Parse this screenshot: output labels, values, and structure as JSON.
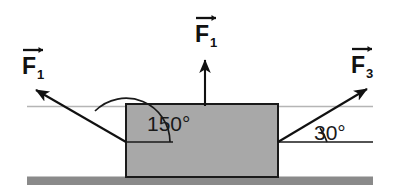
{
  "figure": {
    "type": "free-body-force-diagram",
    "background_color": "#ffffff"
  },
  "block": {
    "name": "block",
    "fill_color": "#a8a8a8",
    "stroke_color": "#1a1a1a"
  },
  "ground": {
    "name": "ground-surface",
    "fill_color": "#8a8a8a"
  },
  "reference_lines": {
    "upper_horizontal_color": "#b5b5b5",
    "lower_horizontal_color": "#1a1a1a"
  },
  "forces": [
    {
      "id": "f1-left",
      "symbol": "F",
      "subscript": "1",
      "label": "F⃗1",
      "direction": "up-left",
      "arrow_color": "#111111"
    },
    {
      "id": "f1-up",
      "symbol": "F",
      "subscript": "1",
      "label": "F⃗1",
      "direction": "up",
      "arrow_color": "#111111"
    },
    {
      "id": "f3-right",
      "symbol": "F",
      "subscript": "3",
      "label": "F⃗3",
      "direction": "up-right",
      "arrow_color": "#111111"
    }
  ],
  "angles": [
    {
      "id": "angle-150",
      "value": "150°",
      "measured_from": "horizontal-right",
      "associated_force": "f1-left"
    },
    {
      "id": "angle-30",
      "value": "30°",
      "measured_from": "horizontal-right",
      "associated_force": "f3-right"
    }
  ]
}
